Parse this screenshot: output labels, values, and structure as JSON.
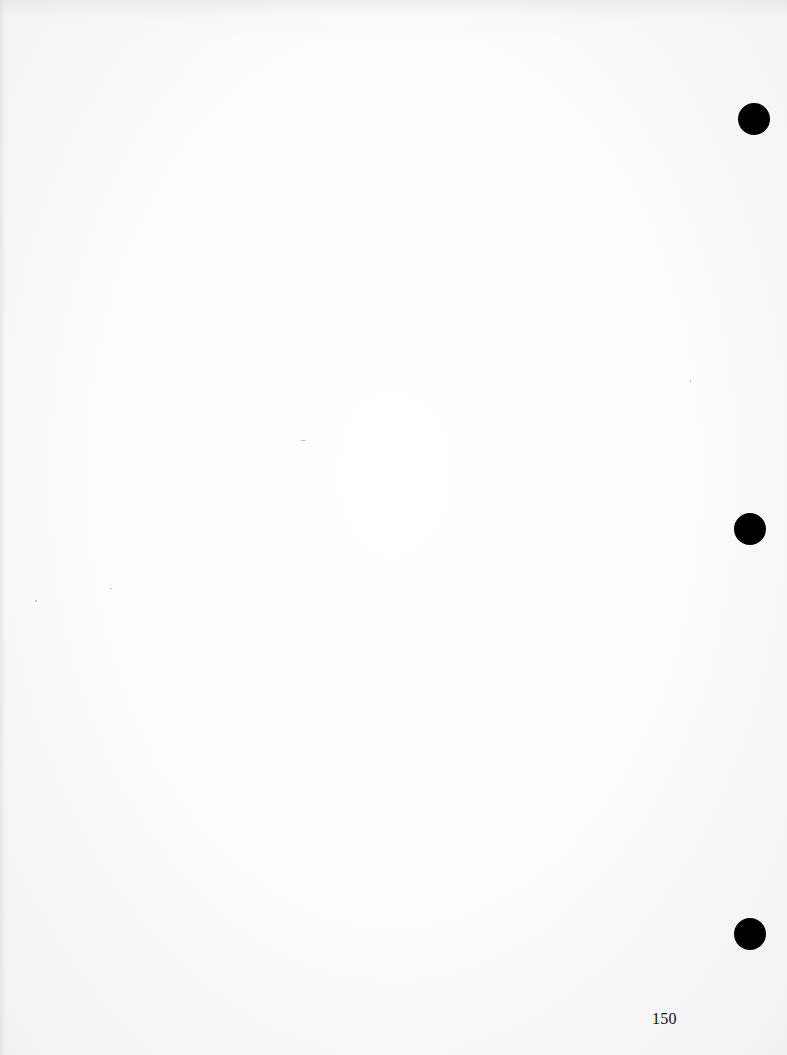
{
  "document": {
    "type": "scanned-page",
    "page_number": "150",
    "background_color": "#fbfbfb",
    "hole_punch_color": "#000000",
    "hole_punches": [
      {
        "position": "top"
      },
      {
        "position": "middle"
      },
      {
        "position": "bottom"
      }
    ]
  }
}
